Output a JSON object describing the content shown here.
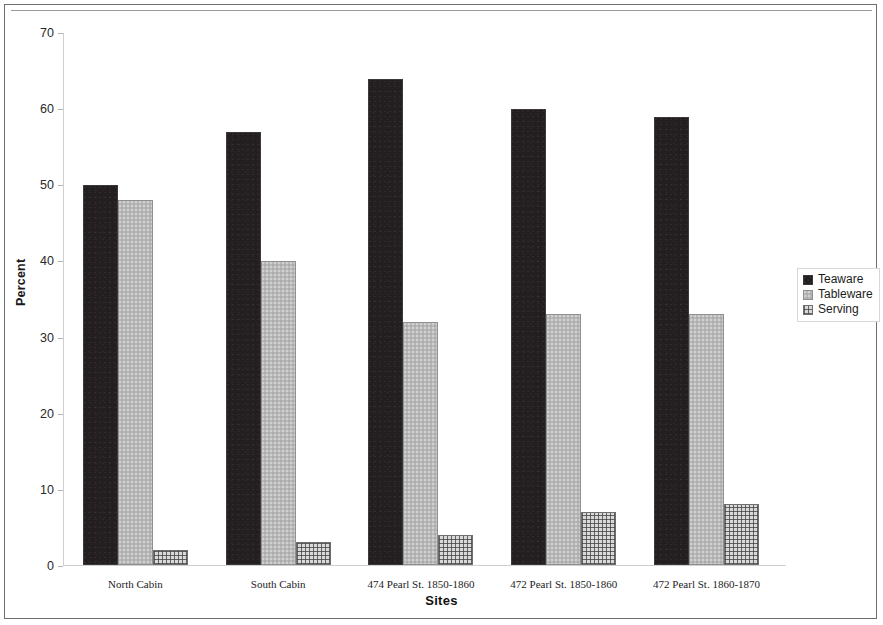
{
  "chart_data": {
    "type": "bar",
    "title": "",
    "xlabel": "Sites",
    "ylabel": "Percent",
    "ylim": [
      0,
      70
    ],
    "y_ticks": [
      0,
      10,
      20,
      30,
      40,
      50,
      60,
      70
    ],
    "grid": false,
    "legend_position": "right",
    "categories": [
      "North Cabin",
      "South Cabin",
      "474 Pearl St.  1850-1860",
      "472 Pearl St. 1850-1860",
      "472 Pearl St.  1860-1870"
    ],
    "series": [
      {
        "name": "Teaware",
        "values": [
          50,
          57,
          64,
          60,
          59
        ],
        "color": "#231f20",
        "pattern": "solid-dark"
      },
      {
        "name": "Tableware",
        "values": [
          48,
          40,
          32,
          33,
          33
        ],
        "color": "#b9b9b9",
        "pattern": "solid-light-gray"
      },
      {
        "name": "Serving",
        "values": [
          2,
          3,
          4,
          7,
          8
        ],
        "color": "#d9d9d9",
        "pattern": "cross-hatch-grid"
      }
    ]
  },
  "axes": {
    "y_title": "Percent",
    "x_title": "Sites",
    "y_tick_labels": [
      "70",
      "60",
      "50",
      "40",
      "30",
      "20",
      "10",
      "0"
    ]
  },
  "legend": {
    "items": [
      {
        "label": "Teaware"
      },
      {
        "label": "Tableware"
      },
      {
        "label": "Serving"
      }
    ]
  }
}
